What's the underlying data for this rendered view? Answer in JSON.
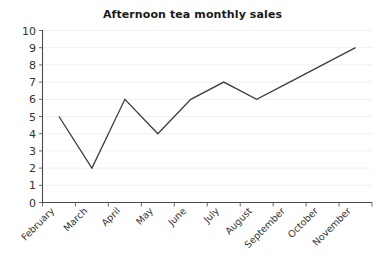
{
  "chart_data": {
    "type": "line",
    "title": "Afternoon tea monthly sales",
    "xlabel": "",
    "ylabel": "",
    "categories": [
      "February",
      "March",
      "April",
      "May",
      "June",
      "July",
      "August",
      "September",
      "October",
      "November"
    ],
    "values": [
      5,
      2,
      6,
      4,
      6,
      7,
      6,
      7,
      8,
      9
    ],
    "series": [
      {
        "name": "Afternoon tea monthly sales",
        "values": [
          5,
          2,
          6,
          4,
          6,
          7,
          6,
          7,
          8,
          9
        ]
      }
    ],
    "ylim": [
      0,
      10
    ],
    "yticks": [
      0,
      1,
      2,
      3,
      4,
      5,
      6,
      7,
      8,
      9,
      10
    ],
    "ytick_labels": [
      "0",
      "1",
      "2",
      "3",
      "4",
      "5",
      "6",
      "7",
      "8",
      "9",
      "10"
    ],
    "grid": true,
    "legend": false,
    "legend_position": "none",
    "line_color": "#3d3d3d",
    "grid_color": "#f0f0f2",
    "axis_color": "#4a4a4a",
    "text_color": "#333333",
    "title_color": "#1a1a1a",
    "xtick_rotation": -45
  }
}
